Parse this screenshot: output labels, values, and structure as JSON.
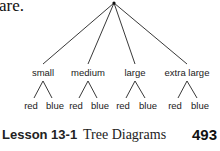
{
  "intro_text": "are.",
  "tree": {
    "root": {
      "x": 114,
      "y": 3
    },
    "branches": [
      {
        "label": "small",
        "x": 43,
        "leaves": [
          "red",
          "blue"
        ]
      },
      {
        "label": "medium",
        "x": 88,
        "leaves": [
          "red",
          "blue"
        ]
      },
      {
        "label": "large",
        "x": 135,
        "leaves": [
          "red",
          "blue"
        ]
      },
      {
        "label": "extra large",
        "x": 187,
        "leaves": [
          "red",
          "blue"
        ]
      }
    ]
  },
  "footer": {
    "lesson_number": "Lesson 13-1",
    "lesson_title": "Tree Diagrams",
    "page_number": "493"
  }
}
